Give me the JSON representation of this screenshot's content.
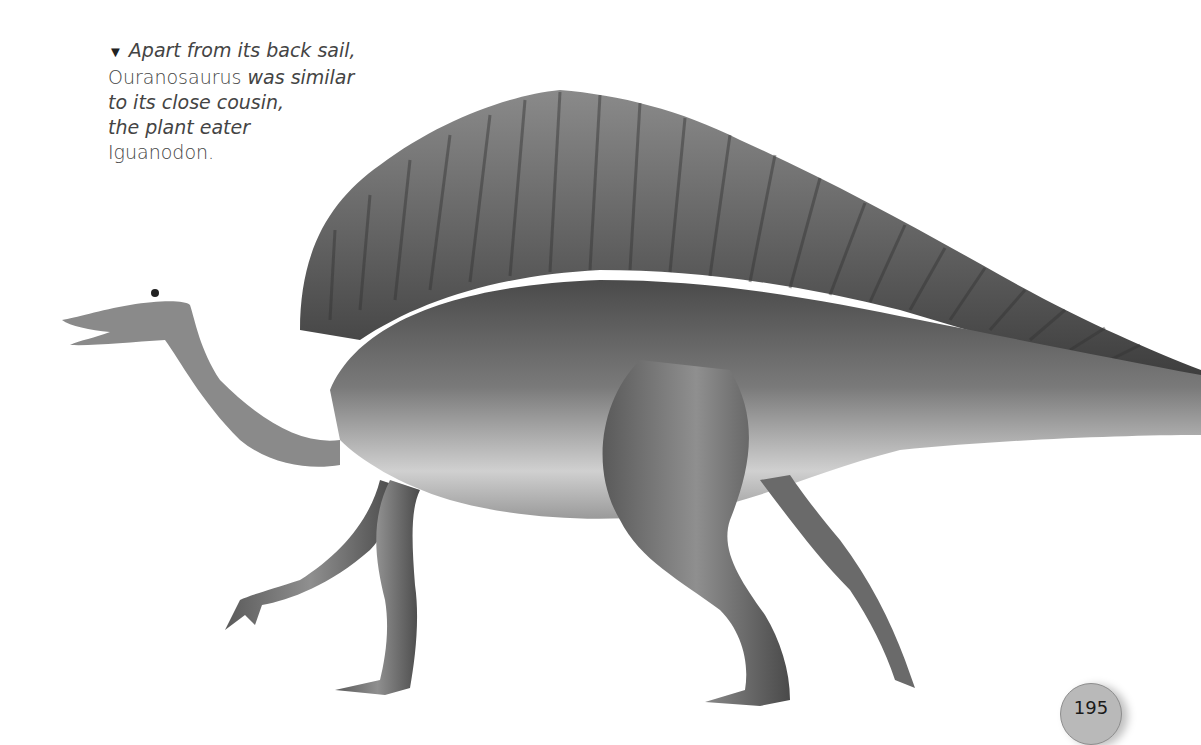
{
  "caption": {
    "marker": "▼",
    "line1": "Apart from its back sail,",
    "line2_roman": "Ouranosaurus",
    "line2_italic": " was similar",
    "line3": "to its close cousin,",
    "line4": "the plant eater",
    "line5": "Iguanodon."
  },
  "illustration": {
    "subject": "Ouranosaurus",
    "description": "Grayscale illustration of a sail-backed dinosaur walking left"
  },
  "page": {
    "number": "195"
  },
  "colors": {
    "text": "#444444",
    "page_badge": "#b9b9b9",
    "sail_dark": "#4a4a4a",
    "body_mid": "#777777",
    "belly_light": "#d8d8d8"
  }
}
